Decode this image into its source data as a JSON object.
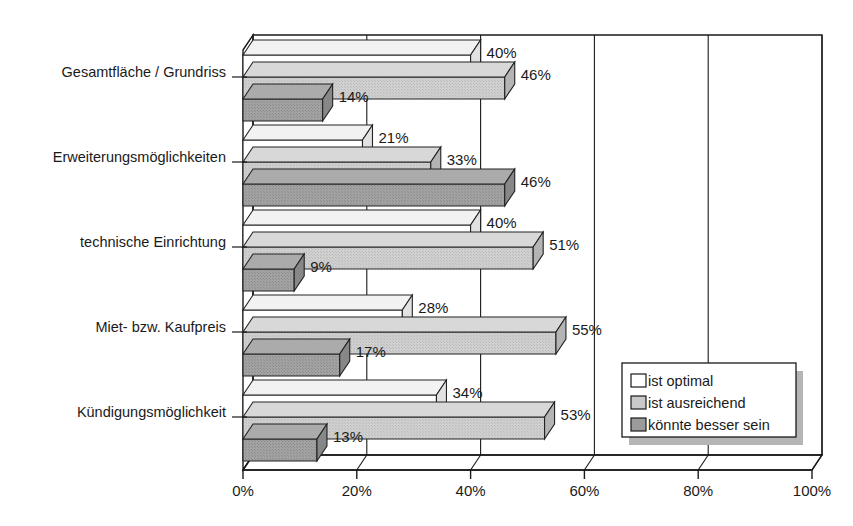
{
  "chart_data": {
    "type": "bar",
    "orientation": "horizontal",
    "title": "",
    "subtitle": "",
    "xlabel": "",
    "ylabel": "",
    "xlim": [
      0,
      100
    ],
    "xticks": [
      0,
      20,
      40,
      60,
      80,
      100
    ],
    "xticklabels": [
      "0%",
      "20%",
      "40%",
      "60%",
      "80%",
      "100%"
    ],
    "grid": true,
    "grid_axis": "x",
    "legend_position": "lower-right",
    "style": "3d-horizontal-bar",
    "categories": [
      "Gesamtfläche / Grundriss",
      "Erweiterungsmöglichkeiten",
      "technische Einrichtung",
      "Miet- bzw. Kaufpreis",
      "Kündigungsmöglichkeit"
    ],
    "series": [
      {
        "name": "ist optimal",
        "color": "#ffffff",
        "values": [
          40,
          21,
          40,
          28,
          34
        ],
        "labels": [
          "40%",
          "21%",
          "40%",
          "28%",
          "34%"
        ]
      },
      {
        "name": "ist ausreichend",
        "color": "#c9c9c9",
        "values": [
          46,
          33,
          51,
          55,
          53
        ],
        "labels": [
          "46%",
          "33%",
          "51%",
          "55%",
          "53%"
        ]
      },
      {
        "name": "könnte besser sein",
        "color": "#9b9b9b",
        "values": [
          14,
          46,
          9,
          17,
          13
        ],
        "labels": [
          "14%",
          "46%",
          "9%",
          "17%",
          "13%"
        ]
      }
    ]
  },
  "legend": {
    "items": [
      {
        "label": "ist optimal",
        "color": "#ffffff"
      },
      {
        "label": "ist ausreichend",
        "color": "#c9c9c9"
      },
      {
        "label": "könnte besser sein",
        "color": "#9b9b9b"
      }
    ]
  },
  "axis": {
    "x_tick_labels": [
      "0%",
      "20%",
      "40%",
      "60%",
      "80%",
      "100%"
    ]
  },
  "category_labels": [
    "Gesamtfläche / Grundriss",
    "Erweiterungsmöglichkeiten",
    "technische Einrichtung",
    "Miet- bzw. Kaufpreis",
    "Kündigungsmöglichkeit"
  ]
}
